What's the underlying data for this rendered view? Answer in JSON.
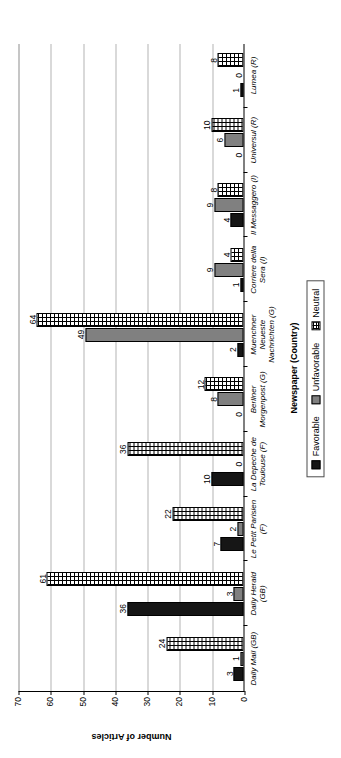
{
  "chart_data": {
    "type": "bar",
    "title": "",
    "xlabel": "Newspaper (Country)",
    "ylabel": "Number of Articles",
    "ylim": [
      0,
      70
    ],
    "yticks": [
      0,
      10,
      20,
      30,
      40,
      50,
      60,
      70
    ],
    "grid": true,
    "legend_position": "bottom",
    "orientation": "vertical-grouped",
    "categories": [
      "Daily Mail (GB)",
      "Daily Herald (GB)",
      "Le Petit Parisien (F)",
      "La Depeche de Toulouse (F)",
      "Berliner Morgenpost (G)",
      "Muenchner Neueste Nachrichten (G)",
      "Corriere della Sera (I)",
      "Il Messaggero (I)",
      "Universul (R)",
      "Lumea (R)"
    ],
    "category_lines": [
      [
        "Daily Mail (GB)"
      ],
      [
        "Daily Herald",
        "(GB)"
      ],
      [
        "Le Petit Parisien",
        "(F)"
      ],
      [
        "La Depeche de",
        "Toulouse (F)"
      ],
      [
        "Berliner",
        "Morgenpost (G)"
      ],
      [
        "Muenchner",
        "Neueste",
        "Nachrichten (G)"
      ],
      [
        "Corriere della",
        "Sera (I)"
      ],
      [
        "Il Messaggero (I)"
      ],
      [
        "Universul (R)"
      ],
      [
        "Lumea (R)"
      ]
    ],
    "series": [
      {
        "name": "Favorable",
        "color": "#161616",
        "values": [
          3,
          36,
          7,
          10,
          0,
          2,
          1,
          4,
          0,
          1
        ]
      },
      {
        "name": "Unfavorable",
        "color": "#808080",
        "values": [
          1,
          3,
          2,
          0,
          8,
          49,
          9,
          9,
          6,
          0
        ]
      },
      {
        "name": "Neutral",
        "color": "#ffffff",
        "values": [
          24,
          61,
          22,
          36,
          12,
          64,
          4,
          8,
          10,
          8
        ]
      }
    ]
  },
  "legend": {
    "items": [
      {
        "label": "Favorable"
      },
      {
        "label": "Unfavorable"
      },
      {
        "label": "Neutral"
      }
    ]
  }
}
